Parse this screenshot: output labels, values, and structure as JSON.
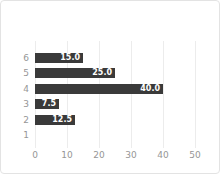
{
  "chart_data": {
    "type": "bar",
    "orientation": "horizontal",
    "title": "",
    "xlabel": "",
    "ylabel": "",
    "categories": [
      "6",
      "5",
      "4",
      "3",
      "2",
      "1"
    ],
    "values": [
      15.0,
      25.0,
      40.0,
      7.5,
      12.5,
      0
    ],
    "data_labels": [
      "15.0",
      "25.0",
      "40.0",
      "7.5",
      "12.5",
      ""
    ],
    "xlim": [
      0,
      50
    ],
    "x_ticks": [
      "0",
      "10",
      "20",
      "30",
      "40",
      "50"
    ],
    "x_tick_values": [
      0,
      10,
      20,
      30,
      40,
      50
    ],
    "grid": "vertical gridlines on",
    "legend": "none",
    "colors": {
      "bar": "#3a3a3a",
      "bar_label": "#ffffff",
      "tick_label": "#969696",
      "gridline": "#ececec",
      "background": "#ffffff",
      "card_border": "#e3e3e3"
    }
  }
}
